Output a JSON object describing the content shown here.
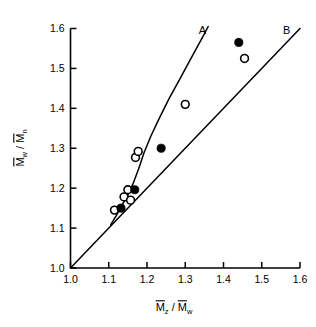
{
  "chart_data": {
    "type": "scatter",
    "title": "",
    "xlabel": "Mz / Mw",
    "ylabel": "Mw / Mn",
    "xlim": [
      1.0,
      1.6
    ],
    "ylim": [
      1.0,
      1.6
    ],
    "xticks": [
      "1.0",
      "1.1",
      "1.2",
      "1.3",
      "1.4",
      "1.5",
      "1.6"
    ],
    "yticks": [
      "1.0",
      "1.1",
      "1.2",
      "1.3",
      "1.4",
      "1.5",
      "1.6"
    ],
    "xtick_values": [
      1.0,
      1.1,
      1.2,
      1.3,
      1.4,
      1.5,
      1.6
    ],
    "ytick_values": [
      1.0,
      1.1,
      1.2,
      1.3,
      1.4,
      1.5,
      1.6
    ],
    "grid": false,
    "legend": "none",
    "series": [
      {
        "name": "open-circles",
        "marker": "open-circle",
        "points": [
          [
            1.115,
            1.145
          ],
          [
            1.14,
            1.178
          ],
          [
            1.15,
            1.196
          ],
          [
            1.157,
            1.17
          ],
          [
            1.17,
            1.277
          ],
          [
            1.177,
            1.292
          ],
          [
            1.3,
            1.41
          ],
          [
            1.455,
            1.525
          ]
        ]
      },
      {
        "name": "filled-circles",
        "marker": "filled-circle",
        "points": [
          [
            1.132,
            1.15
          ],
          [
            1.168,
            1.196
          ],
          [
            1.237,
            1.3
          ],
          [
            1.44,
            1.565
          ]
        ]
      }
    ],
    "curves": [
      {
        "name": "curve-A",
        "label": "A",
        "style": "solid",
        "label_x": 1.345,
        "label_y": 1.595,
        "points": [
          [
            1.105,
            1.108
          ],
          [
            1.12,
            1.132
          ],
          [
            1.135,
            1.158
          ],
          [
            1.15,
            1.183
          ],
          [
            1.163,
            1.21
          ],
          [
            1.178,
            1.248
          ],
          [
            1.192,
            1.288
          ],
          [
            1.21,
            1.33
          ],
          [
            1.232,
            1.375
          ],
          [
            1.258,
            1.425
          ],
          [
            1.285,
            1.472
          ],
          [
            1.315,
            1.525
          ],
          [
            1.345,
            1.578
          ],
          [
            1.36,
            1.605
          ]
        ]
      },
      {
        "name": "curve-B",
        "label": "B",
        "style": "solid",
        "label_x": 1.565,
        "label_y": 1.597,
        "points": [
          [
            1.0,
            1.0
          ],
          [
            1.6,
            1.6
          ]
        ]
      }
    ],
    "axis_labels": {
      "x_numerator": "M",
      "x_numerator_sub": "z",
      "x_denominator": "M",
      "x_denominator_sub": "w",
      "x_separator": "/",
      "y_numerator": "M",
      "y_numerator_sub": "w",
      "y_denominator": "M",
      "y_denominator_sub": "n",
      "y_separator": "/"
    }
  },
  "colors": {
    "axis": "#000000",
    "curve": "#000000",
    "marker_fill": "#000000",
    "marker_open": "#ffffff",
    "background": "#ffffff"
  }
}
